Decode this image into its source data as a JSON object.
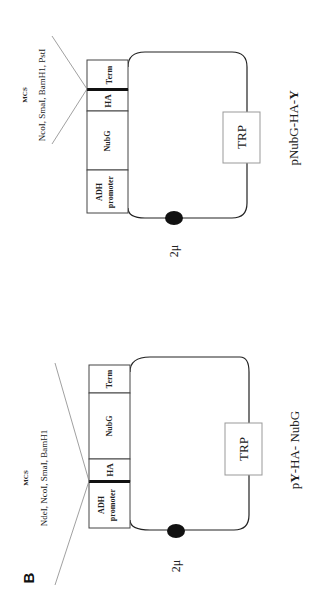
{
  "figure": {
    "panel_label": "B",
    "orientation": "rotated-90-ccw",
    "plasmids": [
      {
        "name_prefix": "p",
        "name_bold": "Y",
        "name_suffix": "-HA- NubG",
        "mcs_title": "MCS",
        "mcs_sites": "NdeI, NcoI, SmaI, BamH1",
        "cassette": [
          {
            "label_line1": "ADH",
            "label_line2": "promoter"
          },
          {
            "label_line1": "HA"
          },
          {
            "label_line1": "NubG"
          },
          {
            "label_line1": "Term"
          }
        ],
        "marker": "TRP",
        "origin": "2μ"
      },
      {
        "name_prefix": "pNubG-HA-",
        "name_bold": "Y",
        "name_suffix": "",
        "mcs_title": "MCS",
        "mcs_sites": "NcoI, SmaI, BamH1, PstI",
        "cassette": [
          {
            "label_line1": "ADH",
            "label_line2": "promoter"
          },
          {
            "label_line1": "NubG"
          },
          {
            "label_line1": "HA"
          },
          {
            "label_line1": "Term"
          }
        ],
        "marker": "TRP",
        "origin": "2μ"
      }
    ]
  }
}
